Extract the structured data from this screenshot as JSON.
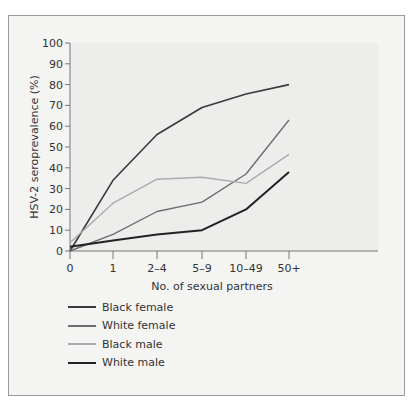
{
  "chart_data": {
    "type": "line",
    "title": "",
    "xlabel": "No. of sexual partners",
    "ylabel": "HSV-2 seroprevalence (%)",
    "categories": [
      "0",
      "1",
      "2–4",
      "5–9",
      "10–49",
      "50+"
    ],
    "yticks": [
      0,
      10,
      20,
      30,
      40,
      50,
      60,
      70,
      80,
      90,
      100
    ],
    "ylim": [
      0,
      100
    ],
    "grid": false,
    "legend_position": "bottom-left",
    "series": [
      {
        "name": "Black female",
        "color": "#3a3a3a",
        "width": 1.6,
        "values": [
          0,
          34,
          56,
          69,
          75.5,
          80
        ]
      },
      {
        "name": "White female",
        "color": "#6e6e6e",
        "width": 1.4,
        "values": [
          0,
          8,
          19,
          23.5,
          37,
          63
        ]
      },
      {
        "name": "Black male",
        "color": "#ababab",
        "width": 1.4,
        "values": [
          4,
          23,
          34.5,
          35.5,
          32.5,
          46.5
        ]
      },
      {
        "name": "White male",
        "color": "#222222",
        "width": 2.0,
        "values": [
          2,
          5,
          8,
          10,
          20,
          38
        ]
      }
    ]
  },
  "legend": {
    "items": [
      {
        "label": "Black female",
        "color": "#3a3a3a"
      },
      {
        "label": "White female",
        "color": "#6e6e6e"
      },
      {
        "label": "Black male",
        "color": "#ababab"
      },
      {
        "label": "White male",
        "color": "#222222"
      }
    ]
  },
  "axes": {
    "ylabel": "HSV-2 seroprevalence (%)",
    "xlabel": "No. of sexual partners"
  }
}
